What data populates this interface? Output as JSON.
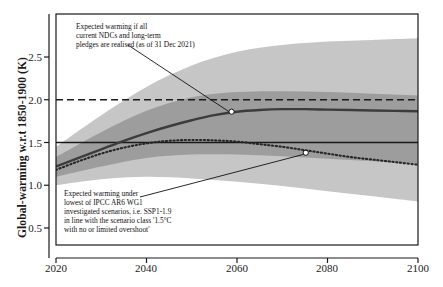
{
  "chart_data": {
    "type": "line",
    "title": "",
    "xlabel": "",
    "ylabel": "Global-warming w.r.t 1850-1900 (K)",
    "xlim": [
      2020,
      2100
    ],
    "ylim": [
      0.3,
      2.75
    ],
    "xticks": [
      "2020",
      "2040",
      "2060",
      "2080",
      "2100"
    ],
    "yticks": [
      "0.5",
      "1.0",
      "1.5",
      "2.0",
      "2.5"
    ],
    "grid": false,
    "legend": "none",
    "reference_lines": [
      {
        "name": "two-degree-line",
        "value": 2.0,
        "style": "dashed",
        "color": "#1a1a1a"
      },
      {
        "name": "one-point-five-degree-line",
        "value": 1.5,
        "style": "solid",
        "color": "#1a1a1a"
      }
    ],
    "series": [
      {
        "name": "NDC pledges median",
        "style": "solid",
        "color": "#3a3a3a",
        "x": [
          2020,
          2025,
          2030,
          2035,
          2040,
          2045,
          2050,
          2055,
          2060,
          2065,
          2070,
          2075,
          2080,
          2085,
          2090,
          2095,
          2100
        ],
        "values": [
          1.22,
          1.32,
          1.42,
          1.52,
          1.61,
          1.69,
          1.76,
          1.82,
          1.86,
          1.88,
          1.89,
          1.89,
          1.885,
          1.88,
          1.875,
          1.87,
          1.865
        ]
      },
      {
        "name": "SSP1-1.9 lowest scenario",
        "style": "dotted",
        "color": "#2a2a2a",
        "x": [
          2020,
          2025,
          2030,
          2035,
          2040,
          2045,
          2050,
          2055,
          2060,
          2065,
          2070,
          2075,
          2080,
          2085,
          2090,
          2095,
          2100
        ],
        "values": [
          1.18,
          1.28,
          1.37,
          1.44,
          1.49,
          1.52,
          1.53,
          1.525,
          1.51,
          1.48,
          1.45,
          1.41,
          1.37,
          1.33,
          1.3,
          1.27,
          1.24
        ]
      }
    ],
    "bands": [
      {
        "name": "outer-uncertainty-band",
        "color": "#c4c4c4",
        "x": [
          2020,
          2030,
          2040,
          2050,
          2060,
          2070,
          2080,
          2090,
          2100
        ],
        "upper": [
          1.45,
          1.82,
          2.15,
          2.4,
          2.56,
          2.64,
          2.68,
          2.7,
          2.72
        ],
        "lower": [
          1.0,
          1.07,
          1.1,
          1.08,
          1.04,
          0.99,
          0.93,
          0.87,
          0.81
        ]
      },
      {
        "name": "inner-uncertainty-band",
        "color": "#9a9a9a",
        "x": [
          2020,
          2030,
          2040,
          2050,
          2060,
          2070,
          2080,
          2090,
          2100
        ],
        "upper": [
          1.33,
          1.62,
          1.87,
          2.03,
          2.09,
          2.1,
          2.09,
          2.07,
          2.05
        ],
        "lower": [
          1.1,
          1.22,
          1.32,
          1.36,
          1.36,
          1.34,
          1.31,
          1.28,
          1.25
        ]
      }
    ],
    "markers": [
      {
        "name": "ndc-marker",
        "x": 2058.8,
        "y": 1.86
      },
      {
        "name": "ssp119-marker",
        "x": 2075.2,
        "y": 1.38
      }
    ],
    "annotations": [
      {
        "name": "ndc-annotation",
        "lines": [
          "Expected warming if all",
          "current NDCs and long-term",
          "pledges are realised (as of 31 Dec 2021)"
        ]
      },
      {
        "name": "ssp119-annotation",
        "lines": [
          "Expected warming under",
          "lowest of IPCC AR6 WG1",
          "investigated scenarios, i.e. SSP1-1.9",
          "in line with the scenario class '1.5°C",
          "with no or limited overshoot'"
        ]
      }
    ]
  }
}
